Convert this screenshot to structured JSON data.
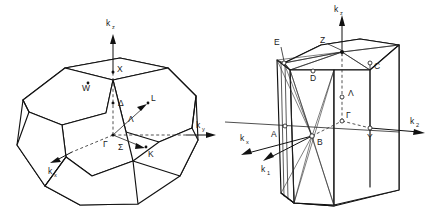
{
  "figure": {
    "title": "",
    "background_color": "#ffffff",
    "line_color": "#111111",
    "panels": [
      {
        "id": "fcc-brillouin-zone",
        "name": "face-centred-cubic-brillouin-zone",
        "shape": "truncated-octahedron",
        "axes": [
          {
            "id": "kz",
            "base": "k",
            "sub": "z",
            "direction": "up"
          },
          {
            "id": "ky",
            "base": "k",
            "sub": "y",
            "direction": "right"
          },
          {
            "id": "kx",
            "base": "k",
            "sub": "x",
            "direction": "lower-left"
          }
        ],
        "symmetry_points": [
          {
            "label": "X",
            "kind": "point"
          },
          {
            "label": "W",
            "kind": "point"
          },
          {
            "label": "L",
            "kind": "point"
          },
          {
            "label": "K",
            "kind": "point"
          },
          {
            "label": "Γ",
            "kind": "point"
          }
        ],
        "symmetry_lines": [
          {
            "label": "Δ",
            "kind": "line"
          },
          {
            "label": "Λ",
            "kind": "line"
          },
          {
            "label": "Σ",
            "kind": "line"
          }
        ]
      },
      {
        "id": "orthorhombic-brillouin-zone",
        "name": "orthorhombic-brillouin-zone",
        "shape": "hexagonal-prism-box",
        "axes": [
          {
            "id": "kz",
            "base": "k",
            "sub": "z",
            "direction": "up"
          },
          {
            "id": "k2",
            "base": "k",
            "sub": "2",
            "direction": "right"
          },
          {
            "id": "kx",
            "base": "k",
            "sub": "x",
            "direction": "lower-left"
          },
          {
            "id": "k1",
            "base": "k",
            "sub": "1",
            "direction": "lower-left"
          }
        ],
        "symmetry_points": [
          {
            "label": "E",
            "kind": "point"
          },
          {
            "label": "Z",
            "kind": "point"
          },
          {
            "label": "C",
            "kind": "point"
          },
          {
            "label": "D",
            "kind": "point"
          },
          {
            "label": "A",
            "kind": "point"
          },
          {
            "label": "B",
            "kind": "point"
          },
          {
            "label": "Y",
            "kind": "point"
          },
          {
            "label": "Γ",
            "kind": "point"
          }
        ],
        "symmetry_lines": [
          {
            "label": "Λ",
            "kind": "line"
          }
        ]
      }
    ]
  }
}
